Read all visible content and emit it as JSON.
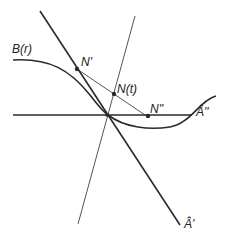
{
  "labels": {
    "curve": "B(r)",
    "n_prime": "N'",
    "n_t": "N(t)",
    "n_double": "N''",
    "a_double": "Â''",
    "a_prime": "Â'"
  },
  "colors": {
    "stroke": "#2a2a2a",
    "text": "#222222"
  }
}
